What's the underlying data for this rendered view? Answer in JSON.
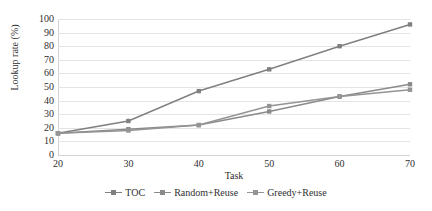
{
  "chart_data": {
    "type": "line",
    "title": "",
    "xlabel": "Task",
    "ylabel": "Lookup rate (%)",
    "x": [
      20,
      30,
      40,
      50,
      60,
      70
    ],
    "xticklabels": [
      "20",
      "30",
      "40",
      "50",
      "60",
      "70"
    ],
    "yticklabels": [
      "0",
      "10",
      "20",
      "30",
      "40",
      "50",
      "60",
      "70",
      "80",
      "90",
      "100"
    ],
    "yticks": [
      0,
      10,
      20,
      30,
      40,
      50,
      60,
      70,
      80,
      90,
      100
    ],
    "xlim": [
      20,
      70
    ],
    "ylim": [
      0,
      100
    ],
    "grid": "horizontal",
    "legend_position": "bottom",
    "series": [
      {
        "name": "TOC",
        "color": "#808080",
        "marker": "square",
        "values": [
          16,
          25,
          47,
          63,
          80,
          96
        ]
      },
      {
        "name": "Random+Reuse",
        "color": "#8a8a8a",
        "marker": "square",
        "values": [
          16,
          19,
          22,
          32,
          43,
          52
        ]
      },
      {
        "name": "Greedy+Reuse",
        "color": "#949494",
        "marker": "square",
        "values": [
          16,
          18,
          22,
          36,
          43,
          48
        ]
      }
    ]
  },
  "colors": {
    "gridline": "#e4e4e4",
    "axis": "#d2d2d2",
    "text": "#2f2f2f",
    "background": "#ffffff"
  }
}
